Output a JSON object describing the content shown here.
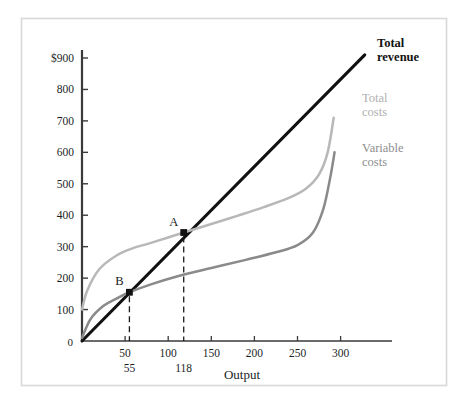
{
  "chart_data": {
    "type": "line",
    "title": "",
    "xlabel": "Output",
    "ylabel": "",
    "xlim": [
      0,
      340
    ],
    "ylim": [
      0,
      950
    ],
    "grid": false,
    "legend_position": "right-inline",
    "x_ticks": [
      50,
      100,
      150,
      200,
      250,
      300
    ],
    "x_tick_labels": [
      "50",
      "100",
      "150",
      "200",
      "250",
      "300"
    ],
    "y_ticks": [
      100,
      200,
      300,
      400,
      500,
      600,
      700,
      800,
      900
    ],
    "y_tick_labels": [
      "100",
      "200",
      "300",
      "400",
      "500",
      "600",
      "700",
      "800",
      "900"
    ],
    "y_top_tick_label": "$900",
    "origin_label": "0",
    "annotations": [
      {
        "name": "break-even-point-A",
        "label": "A",
        "x": 118,
        "y": 345,
        "drop_line": true,
        "x_annotation": "118"
      },
      {
        "name": "break-even-point-B",
        "label": "B",
        "x": 55,
        "y": 155,
        "drop_line": true,
        "x_annotation": "55"
      }
    ],
    "series": [
      {
        "name": "Total revenue",
        "label_lines": [
          "Total",
          "revenue"
        ],
        "color": "#111111",
        "style": "straight-line",
        "points": [
          [
            0,
            0
          ],
          [
            55,
            155
          ],
          [
            118,
            345
          ],
          [
            328,
            910
          ]
        ]
      },
      {
        "name": "Total costs",
        "label_lines": [
          "Total",
          "costs"
        ],
        "color": "#b8b8b8",
        "style": "curve",
        "points": [
          [
            0,
            100
          ],
          [
            6,
            160
          ],
          [
            20,
            228
          ],
          [
            40,
            272
          ],
          [
            60,
            296
          ],
          [
            80,
            312
          ],
          [
            118,
            345
          ],
          [
            150,
            372
          ],
          [
            180,
            398
          ],
          [
            210,
            425
          ],
          [
            240,
            455
          ],
          [
            260,
            485
          ],
          [
            275,
            530
          ],
          [
            285,
            600
          ],
          [
            292,
            710
          ]
        ]
      },
      {
        "name": "Variable costs",
        "label_lines": [
          "Variable",
          "costs"
        ],
        "color": "#8a8a8a",
        "style": "curve",
        "points": [
          [
            0,
            10
          ],
          [
            10,
            70
          ],
          [
            25,
            112
          ],
          [
            40,
            135
          ],
          [
            55,
            155
          ],
          [
            80,
            180
          ],
          [
            110,
            205
          ],
          [
            150,
            232
          ],
          [
            190,
            258
          ],
          [
            225,
            282
          ],
          [
            250,
            305
          ],
          [
            268,
            345
          ],
          [
            280,
            420
          ],
          [
            288,
            520
          ],
          [
            293,
            600
          ]
        ]
      }
    ]
  },
  "frame": {
    "border_color": "#d8d8d8",
    "background": "#ffffff"
  }
}
